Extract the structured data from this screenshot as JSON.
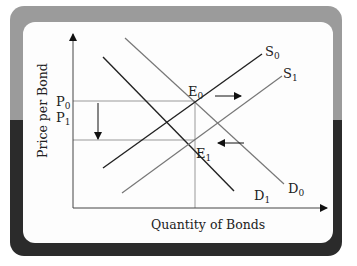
{
  "diagram": {
    "title": "",
    "axes": {
      "x_label": "Quantity of Bonds",
      "y_label": "Price per Bond"
    },
    "price_levels": [
      {
        "label": "P",
        "sub": "0"
      },
      {
        "label": "P",
        "sub": "1"
      }
    ],
    "curves": [
      {
        "id": "S0",
        "label": "S",
        "sub": "0",
        "type": "supply",
        "style": "dark"
      },
      {
        "id": "S1",
        "label": "S",
        "sub": "1",
        "type": "supply",
        "style": "gray"
      },
      {
        "id": "D0",
        "label": "D",
        "sub": "0",
        "type": "demand",
        "style": "gray"
      },
      {
        "id": "D1",
        "label": "D",
        "sub": "1",
        "type": "demand",
        "style": "dark"
      }
    ],
    "equilibria": [
      {
        "label": "E",
        "sub": "0"
      },
      {
        "label": "E",
        "sub": "1"
      }
    ],
    "arrows": [
      {
        "name": "supply-shift-right-arrow",
        "direction": "right"
      },
      {
        "name": "demand-shift-left-arrow",
        "direction": "left"
      },
      {
        "name": "price-fall-arrow",
        "direction": "down"
      }
    ],
    "colors": {
      "frame_top": "#9b9b9b",
      "frame_bottom": "#2b2b2b",
      "panel": "#fdfdfd",
      "dark_line": "#222222",
      "gray_line": "#777777",
      "guide_line": "#999999"
    }
  }
}
